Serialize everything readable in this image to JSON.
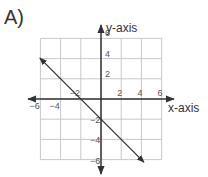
{
  "problem_label": "A)",
  "chart_data": {
    "type": "line",
    "title": "",
    "xlabel": "x-axis",
    "ylabel": "y-axis",
    "xlim": [
      -6,
      6
    ],
    "ylim": [
      -6,
      6
    ],
    "grid": true,
    "x_ticks": [
      -6,
      -4,
      -2,
      2,
      4,
      6
    ],
    "y_ticks": [
      6,
      4,
      2,
      -2,
      -4,
      -6
    ],
    "x_tick_labels": [
      "−6",
      "−4",
      "−2",
      "2",
      "4",
      "6"
    ],
    "y_tick_labels": [
      "6",
      "4",
      "2",
      "−2",
      "−4",
      "−6"
    ],
    "series": [
      {
        "name": "line",
        "equation": "y = -x - 2",
        "x": [
          -6,
          4
        ],
        "y": [
          4,
          -6
        ],
        "arrows": "both"
      }
    ],
    "intercepts": {
      "x": -2,
      "y": -2
    }
  }
}
